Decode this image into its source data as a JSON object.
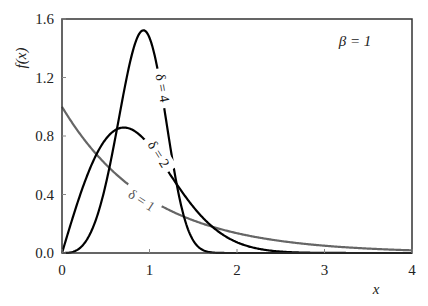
{
  "chart_data": {
    "type": "line",
    "title": "",
    "xlabel": "x",
    "ylabel": "f(x)",
    "xlim": [
      0,
      4
    ],
    "ylim": [
      0,
      1.6
    ],
    "grid": false,
    "xticks": [
      "0",
      "1",
      "2",
      "3",
      "4"
    ],
    "yticks": [
      "0.0",
      "0.4",
      "0.8",
      "1.2",
      "1.6"
    ],
    "annotation": "β = 1",
    "legend_position": "inline labels on curves",
    "function": "Weibull density f(x) = δ x^(δ-1) exp(-x^δ), β = 1",
    "series": [
      {
        "name": "δ = 1",
        "color": "#666666",
        "x": [
          0,
          0.5,
          1,
          1.5,
          2,
          2.5,
          3,
          3.5,
          4
        ],
        "values": [
          1.0,
          0.607,
          0.368,
          0.223,
          0.135,
          0.082,
          0.05,
          0.03,
          0.018
        ]
      },
      {
        "name": "δ = 2",
        "color": "#000000",
        "x": [
          0,
          0.25,
          0.5,
          0.707,
          1,
          1.25,
          1.5,
          2,
          2.5,
          3
        ],
        "values": [
          0,
          0.47,
          0.779,
          0.858,
          0.736,
          0.524,
          0.316,
          0.073,
          0.01,
          0.001
        ]
      },
      {
        "name": "δ = 4",
        "color": "#000000",
        "x": [
          0,
          0.25,
          0.5,
          0.75,
          0.93,
          1,
          1.25,
          1.5,
          1.75,
          2
        ],
        "values": [
          0,
          0.062,
          0.47,
          1.147,
          1.52,
          1.472,
          0.68,
          0.085,
          0.002,
          0
        ]
      }
    ]
  }
}
